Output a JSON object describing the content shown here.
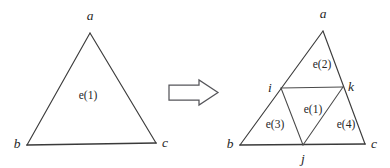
{
  "figure": {
    "background_color": "#ffffff",
    "line_color": "#3c3c3c",
    "text_color": "#262626"
  },
  "left_triangle": {
    "name": "coarse-triangle",
    "vertices": [
      {
        "id": "a",
        "label": "a",
        "x": 90,
        "y": 33,
        "label_x": 90,
        "label_y": 20
      },
      {
        "id": "b",
        "label": "b",
        "x": 27,
        "y": 145,
        "label_x": 17,
        "label_y": 148
      },
      {
        "id": "c",
        "label": "c",
        "x": 156,
        "y": 143,
        "label_x": 165,
        "label_y": 147
      }
    ],
    "elements": [
      {
        "id": "e1",
        "label": "e(1)",
        "x": 88,
        "y": 99
      }
    ]
  },
  "arrow": {
    "name": "transformation-arrow",
    "direction": "right",
    "x": 168,
    "y": 80,
    "width": 50,
    "height": 26
  },
  "right_triangle": {
    "name": "refined-triangle",
    "vertices": [
      {
        "id": "a",
        "label": "a",
        "x": 323,
        "y": 31,
        "label_x": 323,
        "label_y": 18
      },
      {
        "id": "b",
        "label": "b",
        "x": 240,
        "y": 145,
        "label_x": 230,
        "label_y": 148
      },
      {
        "id": "c",
        "label": "c",
        "x": 365,
        "y": 144,
        "label_x": 374,
        "label_y": 148
      },
      {
        "id": "i",
        "label": "i",
        "x": 281,
        "y": 88,
        "label_x": 270,
        "label_y": 90
      },
      {
        "id": "k",
        "label": "k",
        "x": 343,
        "y": 87,
        "label_x": 351,
        "label_y": 89
      },
      {
        "id": "j",
        "label": "j",
        "x": 303,
        "y": 145,
        "label_x": 303,
        "label_y": 162
      }
    ],
    "elements": [
      {
        "id": "e1",
        "label": "e(1)",
        "x": 313,
        "y": 110
      },
      {
        "id": "e2",
        "label": "e(2)",
        "x": 322,
        "y": 64
      },
      {
        "id": "e3",
        "label": "e(3)",
        "x": 275,
        "y": 124
      },
      {
        "id": "e4",
        "label": "e(4)",
        "x": 346,
        "y": 124
      }
    ]
  }
}
